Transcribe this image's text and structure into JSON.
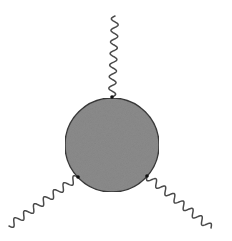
{
  "diagram": {
    "type": "feynman-diagram",
    "canvas": {
      "width": 232,
      "height": 241,
      "background": "#ffffff"
    },
    "blob": {
      "cx": 112,
      "cy": 145,
      "r": 47,
      "fill": "#8c8c8c",
      "stroke": "#3a3a3a",
      "stroke_width": 1.4
    },
    "line_color": "#4a4a4a",
    "line_width": 1.5,
    "external_lines": [
      {
        "name": "top",
        "kind": "wavy",
        "from": [
          112,
          97
        ],
        "to": [
          115,
          16
        ],
        "waves": 7,
        "amplitude": 3.5
      },
      {
        "name": "bottom-left",
        "kind": "wavy",
        "from": [
          78,
          177
        ],
        "to": [
          9,
          226
        ],
        "waves": 7,
        "amplitude": 3.5
      },
      {
        "name": "bottom-right",
        "kind": "wavy",
        "from": [
          147,
          176
        ],
        "to": [
          211,
          228
        ],
        "waves": 7,
        "amplitude": 3.5
      }
    ],
    "vertex_dots": {
      "radius": 1.8,
      "color": "#111111"
    }
  }
}
